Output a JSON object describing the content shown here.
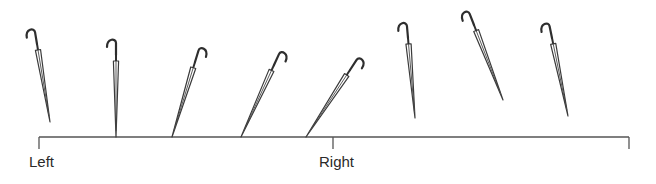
{
  "diagram": {
    "axis": {
      "y": 137,
      "x_start": 39,
      "x_end": 629,
      "ticks": [
        {
          "x": 39,
          "label": "Left"
        },
        {
          "x": 333,
          "label": "Right"
        },
        {
          "x": 629,
          "label": ""
        }
      ],
      "color": "#555555"
    },
    "labels": {
      "left": "Left",
      "right": "Right"
    },
    "umbrellas": [
      {
        "id": 1,
        "top": [
          37,
          44
        ],
        "tip": [
          50,
          122
        ],
        "hook_dir": "left",
        "touches_axis": false
      },
      {
        "id": 2,
        "top": [
          116,
          55
        ],
        "tip": [
          116,
          137
        ],
        "hook_dir": "left",
        "touches_axis": true
      },
      {
        "id": 3,
        "top": [
          195,
          62
        ],
        "tip": [
          172,
          137
        ],
        "hook_dir": "right",
        "touches_axis": true
      },
      {
        "id": 4,
        "top": [
          274,
          65
        ],
        "tip": [
          241,
          137
        ],
        "hook_dir": "right",
        "touches_axis": true
      },
      {
        "id": 5,
        "top": [
          350,
          70
        ],
        "tip": [
          306,
          137
        ],
        "hook_dir": "right",
        "touches_axis": true
      },
      {
        "id": 6,
        "top": [
          408,
          38
        ],
        "tip": [
          415,
          118
        ],
        "hook_dir": "left",
        "touches_axis": false
      },
      {
        "id": 7,
        "top": [
          474,
          25
        ],
        "tip": [
          503,
          100
        ],
        "hook_dir": "left",
        "touches_axis": false
      },
      {
        "id": 8,
        "top": [
          552,
          38
        ],
        "tip": [
          568,
          116
        ],
        "hook_dir": "left",
        "touches_axis": false
      }
    ],
    "colors": {
      "line": "#3a3a3a",
      "background": "#ffffff"
    }
  }
}
